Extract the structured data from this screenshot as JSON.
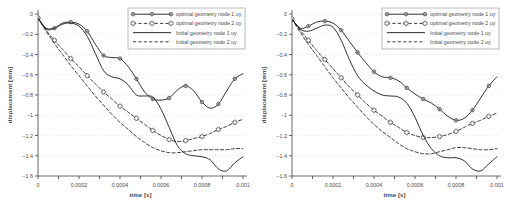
{
  "figure": {
    "panel_count": 2,
    "background": "#ffffff",
    "axis_color": "#555555",
    "grid_color": "#c8c8c8",
    "curve_color": "#1a1a1a"
  },
  "chart_data": [
    {
      "type": "line",
      "panel": "left",
      "title": "",
      "xlabel": "time [s]",
      "ylabel": "displacement [mm]",
      "xlim": [
        0,
        0.001
      ],
      "ylim": [
        -1.6,
        0
      ],
      "xticks": [
        0,
        0.0002,
        0.0004,
        0.0006,
        0.0008,
        0.001
      ],
      "xticklabels": [
        "0",
        "0.0002",
        "0.0004",
        "0.0006",
        "0.0008",
        "0.001"
      ],
      "yticks": [
        0,
        -0.2,
        -0.4,
        -0.6,
        -0.8,
        -1,
        -1.2,
        -1.4,
        -1.6
      ],
      "yticklabels": [
        "0",
        "-0.2",
        "-0.4",
        "-0.6",
        "-0.8",
        "-1",
        "-1.2",
        "-1.4",
        "-1.6"
      ],
      "grid": true,
      "legend_position": "top-right",
      "series": [
        {
          "name": "optimal geometry node 1 uy",
          "style": "solid",
          "marker": "circle-cross",
          "x": [
            0,
            4e-05,
            8e-05,
            0.00012,
            0.00016,
            0.0002,
            0.00024,
            0.00028,
            0.00032,
            0.00036,
            0.0004,
            0.00044,
            0.00048,
            0.00052,
            0.00056,
            0.0006,
            0.00064,
            0.00068,
            0.00072,
            0.00076,
            0.0008,
            0.00084,
            0.00088,
            0.00092,
            0.00096,
            0.001
          ],
          "y": [
            -0.04,
            -0.15,
            -0.14,
            -0.09,
            -0.08,
            -0.1,
            -0.17,
            -0.3,
            -0.41,
            -0.43,
            -0.44,
            -0.52,
            -0.64,
            -0.77,
            -0.84,
            -0.85,
            -0.83,
            -0.75,
            -0.71,
            -0.76,
            -0.87,
            -0.93,
            -0.89,
            -0.76,
            -0.64,
            -0.59
          ]
        },
        {
          "name": "optimal geometry node 2 uy",
          "style": "dashed",
          "marker": "plus-box",
          "x": [
            0,
            4e-05,
            8e-05,
            0.00012,
            0.00016,
            0.0002,
            0.00024,
            0.00028,
            0.00032,
            0.00036,
            0.0004,
            0.00044,
            0.00048,
            0.00052,
            0.00056,
            0.0006,
            0.00064,
            0.00068,
            0.00072,
            0.00076,
            0.0008,
            0.00084,
            0.00088,
            0.00092,
            0.00096,
            0.001
          ],
          "y": [
            -0.04,
            -0.16,
            -0.26,
            -0.35,
            -0.44,
            -0.52,
            -0.61,
            -0.69,
            -0.77,
            -0.84,
            -0.91,
            -0.97,
            -1.03,
            -1.09,
            -1.15,
            -1.2,
            -1.24,
            -1.26,
            -1.25,
            -1.23,
            -1.21,
            -1.18,
            -1.14,
            -1.11,
            -1.07,
            -1.04
          ]
        },
        {
          "name": "Initial geometry node 1 uy",
          "style": "solid",
          "marker": "none",
          "x": [
            0,
            4e-05,
            8e-05,
            0.00012,
            0.00016,
            0.0002,
            0.00024,
            0.00028,
            0.00032,
            0.00036,
            0.0004,
            0.00044,
            0.00048,
            0.00052,
            0.00056,
            0.0006,
            0.00064,
            0.00068,
            0.00072,
            0.00076,
            0.0008,
            0.00084,
            0.00088,
            0.00092,
            0.00096,
            0.001
          ],
          "y": [
            -0.04,
            -0.14,
            -0.14,
            -0.1,
            -0.09,
            -0.12,
            -0.22,
            -0.39,
            -0.56,
            -0.62,
            -0.64,
            -0.7,
            -0.8,
            -0.81,
            -0.82,
            -0.94,
            -1.12,
            -1.3,
            -1.38,
            -1.4,
            -1.41,
            -1.44,
            -1.53,
            -1.55,
            -1.47,
            -1.41
          ]
        },
        {
          "name": "Initial geometry node 2 uy",
          "style": "dashed",
          "marker": "none",
          "x": [
            0,
            4e-05,
            8e-05,
            0.00012,
            0.00016,
            0.0002,
            0.00024,
            0.00028,
            0.00032,
            0.00036,
            0.0004,
            0.00044,
            0.00048,
            0.00052,
            0.00056,
            0.0006,
            0.00064,
            0.00068,
            0.00072,
            0.00076,
            0.0008,
            0.00084,
            0.00088,
            0.00092,
            0.00096,
            0.001
          ],
          "y": [
            -0.04,
            -0.17,
            -0.29,
            -0.4,
            -0.51,
            -0.61,
            -0.71,
            -0.81,
            -0.9,
            -0.99,
            -1.07,
            -1.14,
            -1.21,
            -1.27,
            -1.32,
            -1.35,
            -1.37,
            -1.37,
            -1.36,
            -1.35,
            -1.34,
            -1.34,
            -1.34,
            -1.34,
            -1.33,
            -1.33
          ]
        }
      ]
    },
    {
      "type": "line",
      "panel": "right",
      "title": "",
      "xlabel": "time [s]",
      "ylabel": "displacement [mm]",
      "xlim": [
        0,
        0.001
      ],
      "ylim": [
        -1.6,
        0
      ],
      "xticks": [
        0,
        0.0002,
        0.0004,
        0.0006,
        0.0008,
        0.001
      ],
      "xticklabels": [
        "0",
        "0.0002",
        "0.0004",
        "0.0006",
        "0.0008",
        "0.001"
      ],
      "yticks": [
        0,
        -0.2,
        -0.4,
        -0.6,
        -0.8,
        -1,
        -1.2,
        -1.4,
        -1.6
      ],
      "yticklabels": [
        "0",
        "-0.2",
        "-0.4",
        "-0.6",
        "-0.8",
        "-1",
        "-1.2",
        "-1.4",
        "-1.6"
      ],
      "grid": true,
      "legend_position": "top-right",
      "series": [
        {
          "name": "optimal geometry node 1 uy",
          "style": "solid",
          "marker": "circle-cross",
          "x": [
            0,
            4e-05,
            8e-05,
            0.00012,
            0.00016,
            0.0002,
            0.00024,
            0.00028,
            0.00032,
            0.00036,
            0.0004,
            0.00044,
            0.00048,
            0.00052,
            0.00056,
            0.0006,
            0.00064,
            0.00068,
            0.00072,
            0.00076,
            0.0008,
            0.00084,
            0.00088,
            0.00092,
            0.00096,
            0.001
          ],
          "y": [
            -0.05,
            -0.14,
            -0.12,
            -0.08,
            -0.07,
            -0.09,
            -0.16,
            -0.27,
            -0.38,
            -0.48,
            -0.57,
            -0.62,
            -0.63,
            -0.66,
            -0.73,
            -0.79,
            -0.84,
            -0.88,
            -0.94,
            -1.01,
            -1.05,
            -1.03,
            -0.95,
            -0.83,
            -0.71,
            -0.62
          ]
        },
        {
          "name": "optimal geometry node 2 uy",
          "style": "dashed",
          "marker": "plus-box",
          "x": [
            0,
            4e-05,
            8e-05,
            0.00012,
            0.00016,
            0.0002,
            0.00024,
            0.00028,
            0.00032,
            0.00036,
            0.0004,
            0.00044,
            0.00048,
            0.00052,
            0.00056,
            0.0006,
            0.00064,
            0.00068,
            0.00072,
            0.00076,
            0.0008,
            0.00084,
            0.00088,
            0.00092,
            0.00096,
            0.001
          ],
          "y": [
            -0.05,
            -0.16,
            -0.26,
            -0.36,
            -0.45,
            -0.54,
            -0.63,
            -0.72,
            -0.8,
            -0.88,
            -0.95,
            -1.01,
            -1.07,
            -1.12,
            -1.17,
            -1.2,
            -1.22,
            -1.22,
            -1.21,
            -1.19,
            -1.16,
            -1.12,
            -1.08,
            -1.05,
            -1.01,
            -0.98
          ]
        },
        {
          "name": "Initial geometry node 1 uy",
          "style": "solid",
          "marker": "none",
          "x": [
            0,
            4e-05,
            8e-05,
            0.00012,
            0.00016,
            0.0002,
            0.00024,
            0.00028,
            0.00032,
            0.00036,
            0.0004,
            0.00044,
            0.00048,
            0.00052,
            0.00056,
            0.0006,
            0.00064,
            0.00068,
            0.00072,
            0.00076,
            0.0008,
            0.00084,
            0.00088,
            0.00092,
            0.00096,
            0.001
          ],
          "y": [
            -0.05,
            -0.15,
            -0.17,
            -0.14,
            -0.11,
            -0.13,
            -0.26,
            -0.45,
            -0.61,
            -0.7,
            -0.76,
            -0.8,
            -0.81,
            -0.82,
            -0.88,
            -1.02,
            -1.2,
            -1.33,
            -1.4,
            -1.42,
            -1.42,
            -1.45,
            -1.53,
            -1.55,
            -1.48,
            -1.41
          ]
        },
        {
          "name": "Initial geometry node 2 uy",
          "style": "dashed",
          "marker": "none",
          "x": [
            0,
            4e-05,
            8e-05,
            0.00012,
            0.00016,
            0.0002,
            0.00024,
            0.00028,
            0.00032,
            0.00036,
            0.0004,
            0.00044,
            0.00048,
            0.00052,
            0.00056,
            0.0006,
            0.00064,
            0.00068,
            0.00072,
            0.00076,
            0.0008,
            0.00084,
            0.00088,
            0.00092,
            0.00096,
            0.001
          ],
          "y": [
            -0.05,
            -0.18,
            -0.3,
            -0.41,
            -0.52,
            -0.63,
            -0.73,
            -0.83,
            -0.92,
            -1.01,
            -1.09,
            -1.16,
            -1.22,
            -1.28,
            -1.33,
            -1.36,
            -1.38,
            -1.38,
            -1.36,
            -1.34,
            -1.32,
            -1.32,
            -1.33,
            -1.34,
            -1.34,
            -1.33
          ]
        }
      ]
    }
  ]
}
